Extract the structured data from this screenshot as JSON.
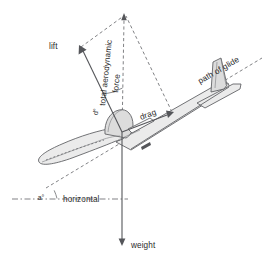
{
  "diagram": {
    "background_color": "#ffffff",
    "line_color": "#55565a",
    "dash_color": "#6a6b6f",
    "text_color": "#2b2b2b",
    "fill_color": "#e6e6e6"
  },
  "labels": {
    "lift": "lift",
    "total_aerodynamic": "total aerodynamic",
    "force": "force",
    "drag": "drag",
    "path_of_glide": "path of glide",
    "horizontal": "horizontal",
    "weight": "weight",
    "angle_alpha": "a°",
    "angle_delta": "d°"
  },
  "vectors": [
    {
      "name": "lift",
      "label": "lift",
      "style": "solid-arrow",
      "from": [
        122,
        132
      ],
      "to": [
        80,
        48
      ],
      "arrow_at": "to"
    },
    {
      "name": "drag",
      "label": "drag",
      "style": "solid-arrow",
      "from": [
        122,
        132
      ],
      "to": [
        173,
        113
      ],
      "arrow_at": "to"
    },
    {
      "name": "total-aerodynamic-force",
      "label": "total aerodynamic force",
      "style": "dashed",
      "from": [
        122,
        132
      ],
      "to": [
        124,
        14
      ],
      "arrow_at": "to"
    },
    {
      "name": "weight",
      "label": "weight",
      "style": "solid-arrow",
      "from": [
        122,
        132
      ],
      "to": [
        122,
        244
      ],
      "arrow_at": "to"
    }
  ],
  "construction_lines": [
    {
      "name": "lift-to-resultant",
      "style": "dashed",
      "from": [
        80,
        48
      ],
      "to": [
        124,
        16
      ]
    },
    {
      "name": "drag-to-resultant",
      "style": "dashed",
      "from": [
        173,
        113
      ],
      "to": [
        124,
        16
      ]
    },
    {
      "name": "path-of-glide",
      "style": "dashed",
      "from": [
        46,
        188
      ],
      "to": [
        262,
        58
      ]
    },
    {
      "name": "horizontal-reference",
      "style": "dashdot",
      "from": [
        12,
        199
      ],
      "to": [
        128,
        199
      ]
    }
  ],
  "angles": [
    {
      "name": "alpha",
      "label": "a°",
      "vertex": [
        12,
        199
      ],
      "between": [
        "horizontal",
        "path-of-glide"
      ]
    },
    {
      "name": "delta",
      "label": "d°",
      "vertex": [
        122,
        132
      ],
      "between": [
        "lift",
        "total-aerodynamic-force"
      ]
    }
  ]
}
